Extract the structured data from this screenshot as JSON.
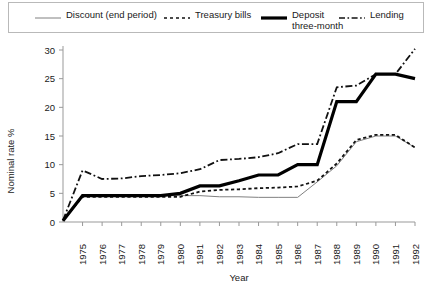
{
  "chart_data": {
    "type": "line",
    "title": "",
    "xlabel": "Year",
    "ylabel": "Nominal rate %",
    "xlim": [
      1974,
      1992
    ],
    "ylim": [
      0,
      30
    ],
    "grid": false,
    "legend_position": "top",
    "x": [
      1974,
      1975,
      1976,
      1977,
      1978,
      1979,
      1980,
      1981,
      1982,
      1983,
      1984,
      1985,
      1986,
      1987,
      1988,
      1989,
      1990,
      1991,
      1992
    ],
    "xtick_labels": [
      "1975",
      "1976",
      "1977",
      "1978",
      "1979",
      "1980",
      "1981",
      "1982",
      "1983",
      "1984",
      "1985",
      "1986",
      "1987",
      "1988",
      "1989",
      "1990",
      "1991",
      "1992"
    ],
    "ytick_labels": [
      "0",
      "5",
      "10",
      "15",
      "20",
      "25",
      "30"
    ],
    "ytick_values": [
      0,
      5,
      10,
      15,
      20,
      25,
      30
    ],
    "series": [
      {
        "name": "Discount (end period)",
        "style": "thin-solid-gray",
        "color": "#808080",
        "values": [
          0.2,
          4.6,
          4.6,
          4.6,
          4.6,
          4.6,
          4.6,
          4.6,
          4.4,
          4.4,
          4.3,
          4.3,
          4.3,
          7.0,
          9.8,
          14.0,
          15.0,
          15.0,
          13.0
        ]
      },
      {
        "name": "Treasury bills",
        "style": "dotted",
        "color": "#111111",
        "values": [
          0.3,
          4.4,
          4.4,
          4.4,
          4.4,
          4.4,
          4.4,
          5.3,
          5.6,
          5.7,
          5.9,
          6.0,
          6.2,
          7.2,
          10.2,
          14.3,
          15.2,
          15.2,
          13.0
        ]
      },
      {
        "name": "Deposit three-month",
        "style": "thick-solid",
        "color": "#000000",
        "values": [
          0.2,
          4.6,
          4.6,
          4.6,
          4.6,
          4.6,
          5.0,
          6.3,
          6.3,
          7.2,
          8.2,
          8.2,
          10.0,
          10.0,
          21.0,
          21.0,
          25.8,
          25.8,
          25.0
        ]
      },
      {
        "name": "Lending",
        "style": "dash-dot",
        "color": "#111111",
        "values": [
          0.3,
          9.0,
          7.5,
          7.6,
          8.0,
          8.2,
          8.5,
          9.2,
          10.8,
          11.0,
          11.3,
          12.0,
          13.6,
          13.6,
          23.5,
          23.8,
          25.8,
          25.8,
          30.2
        ]
      }
    ]
  },
  "legend": {
    "items": [
      {
        "label": "Discount (end period)",
        "style": "thin-solid-gray"
      },
      {
        "label": "Treasury bills",
        "style": "dotted"
      },
      {
        "label": "Deposit",
        "label2": "three-month",
        "style": "thick-solid"
      },
      {
        "label": "Lending",
        "style": "dash-dot"
      }
    ]
  },
  "axes": {
    "y_title": "Nominal rate %",
    "x_title": "Year"
  }
}
